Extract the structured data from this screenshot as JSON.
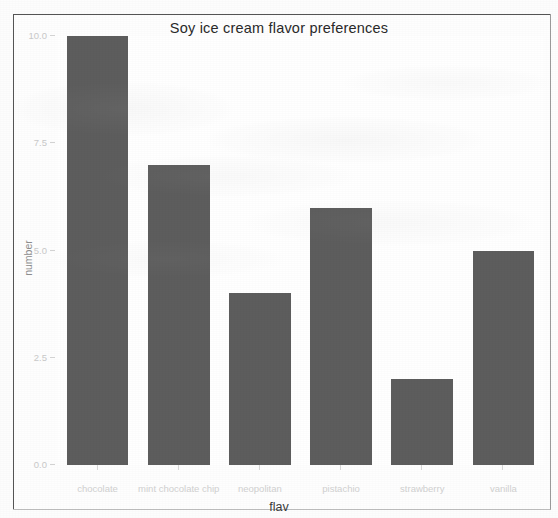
{
  "chart_data": {
    "type": "bar",
    "title": "Soy ice cream flavor preferences",
    "xlabel": "flav",
    "ylabel": "number",
    "categories": [
      "chocolate",
      "mint chocolate chip",
      "neopolitan",
      "pistachio",
      "strawberry",
      "vanilla"
    ],
    "values": [
      10.0,
      7.0,
      4.0,
      6.0,
      2.0,
      5.0
    ],
    "ylim": [
      0,
      10
    ],
    "yticks": [
      0.0,
      2.5,
      5.0,
      7.5,
      10.0
    ],
    "ytick_labels": [
      "0.0",
      "2.5",
      "5.0",
      "7.5",
      "10.0"
    ],
    "grid": false,
    "legend": false,
    "bar_color": "#5d5d5d",
    "panel_background": "#ffffff"
  }
}
